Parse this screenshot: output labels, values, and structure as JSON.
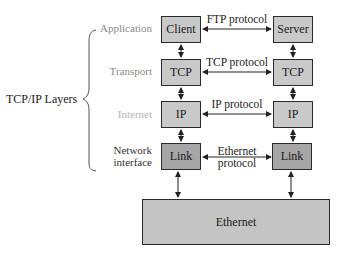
{
  "diagram": {
    "side_label": "TCP/IP Layers",
    "layers": [
      {
        "label": "Application",
        "color": "#8a8a8a"
      },
      {
        "label": "Transport",
        "color": "#8a8a8a"
      },
      {
        "label": "Internet",
        "color": "#b5b5b5"
      },
      {
        "label_line1": "Network",
        "label_line2": "interface",
        "color": "#333333"
      }
    ],
    "left_stack": [
      "Client",
      "TCP",
      "IP",
      "Link"
    ],
    "right_stack": [
      "Server",
      "TCP",
      "IP",
      "Link"
    ],
    "protocols": [
      {
        "label": "FTP protocol"
      },
      {
        "label": "TCP protocol"
      },
      {
        "label": "IP protocol"
      },
      {
        "label_line1": "Ethernet",
        "label_line2": "protocol"
      }
    ],
    "network": "Ethernet",
    "colors": {
      "light_box": "#c9c9c9",
      "link_box": "#a6a6a6",
      "ethernet_box": "#c4c4c4",
      "border": "#2a2a2a"
    }
  }
}
